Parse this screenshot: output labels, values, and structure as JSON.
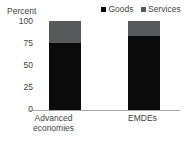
{
  "chart_data": {
    "type": "bar",
    "stacked": true,
    "title": "",
    "subtitle": "",
    "xlabel": "",
    "ylabel": "Percent",
    "ylim": [
      0,
      100
    ],
    "yticks": [
      100,
      75,
      50,
      25,
      0
    ],
    "ytick_labels": [
      "100",
      "75",
      "50",
      "25",
      "0"
    ],
    "grid": false,
    "legend_position": "top-right",
    "categories": [
      "Advanced\neconomies",
      "EMDEs"
    ],
    "category_labels_flat": [
      "Advanced economies",
      "EMDEs"
    ],
    "series": [
      {
        "name": "Goods",
        "color": "#0b0b0b",
        "values": [
          75,
          83
        ]
      },
      {
        "name": "Services",
        "color": "#58595b",
        "values": [
          25,
          17
        ]
      }
    ]
  },
  "legend": {
    "entries": [
      {
        "label": "Goods",
        "swatch_name": "legend-swatch-goods"
      },
      {
        "label": "Services",
        "swatch_name": "legend-swatch-services"
      }
    ]
  },
  "axis": {
    "y_title": "Percent",
    "ticks": [
      "100",
      "75",
      "50",
      "25",
      "0"
    ]
  },
  "colors": {
    "goods": "#0b0b0b",
    "services": "#58595b",
    "axis_line": "#a6a6a6",
    "text": "#3f3f3f",
    "background": "#ffffff"
  }
}
